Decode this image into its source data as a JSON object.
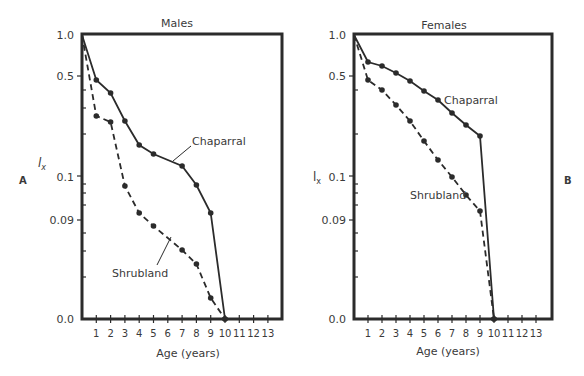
{
  "chart_data": [
    {
      "panel_label": "A",
      "type": "line",
      "title": "Males",
      "xlabel": "Age (years)",
      "ylabel": "l_x",
      "ylabel_display": "l",
      "ylabel_sub": "x",
      "x_ticks": [
        "1",
        "2",
        "3",
        "4",
        "5",
        "6",
        "7",
        "8",
        "9",
        "10",
        "11",
        "12",
        "13"
      ],
      "y_ticks": [
        "1.0",
        "0.5",
        "0.1",
        "0.09",
        "0.0"
      ],
      "ylim": [
        0.0,
        1.0
      ],
      "xlim": [
        0,
        14
      ],
      "grid": false,
      "legend": "inline labels",
      "series": [
        {
          "name": "Chaparral",
          "style": "solid",
          "x": [
            0,
            1,
            2,
            3,
            4,
            5,
            7,
            8,
            9,
            10
          ],
          "values": [
            1.0,
            0.46,
            0.4,
            0.25,
            0.16,
            0.14,
            0.12,
            0.1,
            0.093,
            0.0
          ]
        },
        {
          "name": "Shrubland",
          "style": "dashed",
          "x": [
            0,
            1,
            2,
            3,
            4,
            5,
            7,
            8,
            9,
            10
          ],
          "values": [
            1.0,
            0.27,
            0.25,
            0.1,
            0.093,
            0.09,
            0.075,
            0.065,
            0.03,
            0.0
          ]
        }
      ]
    },
    {
      "panel_label": "B",
      "type": "line",
      "title": "Females",
      "xlabel": "Age (years)",
      "ylabel": "l_x",
      "ylabel_display": "l",
      "ylabel_sub": "x",
      "x_ticks": [
        "1",
        "2",
        "3",
        "4",
        "5",
        "6",
        "7",
        "8",
        "9",
        "10",
        "11",
        "12",
        "13"
      ],
      "y_ticks": [
        "1.0",
        "0.5",
        "0.1",
        "0.09",
        "0.0"
      ],
      "ylim": [
        0.0,
        1.0
      ],
      "xlim": [
        0,
        14
      ],
      "grid": false,
      "legend": "inline labels",
      "series": [
        {
          "name": "Chaparral",
          "style": "solid",
          "x": [
            0,
            1,
            2,
            3,
            4,
            5,
            6,
            7,
            8,
            9,
            10
          ],
          "values": [
            1.0,
            0.62,
            0.6,
            0.55,
            0.48,
            0.42,
            0.36,
            0.3,
            0.25,
            0.2,
            0.0
          ]
        },
        {
          "name": "Shrubland",
          "style": "dashed",
          "x": [
            0,
            1,
            2,
            3,
            4,
            5,
            6,
            7,
            8,
            9,
            10
          ],
          "values": [
            1.0,
            0.46,
            0.4,
            0.32,
            0.25,
            0.18,
            0.13,
            0.1,
            0.095,
            0.093,
            0.0
          ]
        }
      ]
    }
  ],
  "panels": {
    "males": {
      "title": "Males",
      "label": "A",
      "xlabel": "Age (years)",
      "ylabel": "l",
      "ylabel_sub": "x",
      "chaparral_label": "Chaparral",
      "shrubland_label": "Shrubland"
    },
    "females": {
      "title": "Females",
      "label": "B",
      "xlabel": "Age (years)",
      "ylabel": "l",
      "ylabel_sub": "x",
      "chaparral_label": "Chaparral",
      "shrubland_label": "Shrubland"
    }
  },
  "y_tick_labels": {
    "t1": "1.0",
    "t05": "0.5",
    "t01": "0.1",
    "t009": "0.09",
    "t0": "0.0"
  },
  "x_tick_labels": [
    "1",
    "2",
    "3",
    "4",
    "5",
    "6",
    "7",
    "8",
    "9",
    "10",
    "11",
    "12",
    "13"
  ],
  "pixel_layout": {
    "males": {
      "x0": 82,
      "x_step": 14.3,
      "chap_y": [
        35,
        80,
        93,
        121,
        145,
        154,
        166,
        185,
        213,
        319
      ],
      "chap_x": [
        0,
        1,
        2,
        3,
        4,
        5,
        7,
        8,
        9,
        10
      ],
      "shrub_y": [
        35,
        116,
        122,
        186,
        213,
        226,
        250,
        264,
        298,
        319
      ],
      "shrub_x": [
        0,
        1,
        2,
        3,
        4,
        5,
        7,
        8,
        9,
        10
      ]
    },
    "females": {
      "x0": 354,
      "x_step": 14.0,
      "chap_y": [
        35,
        62,
        66,
        73,
        81,
        91,
        100,
        113,
        125,
        136,
        319
      ],
      "chap_x": [
        0,
        1,
        2,
        3,
        4,
        5,
        6,
        7,
        8,
        9,
        10
      ],
      "shrub_y": [
        35,
        80,
        90,
        105,
        121,
        141,
        160,
        177,
        195,
        211,
        319
      ],
      "shrub_x": [
        0,
        1,
        2,
        3,
        4,
        5,
        6,
        7,
        8,
        9,
        10
      ]
    }
  }
}
